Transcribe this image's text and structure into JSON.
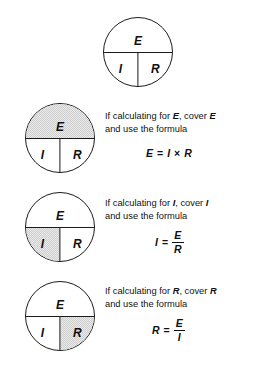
{
  "diagram": {
    "wheel_labels": {
      "top": "E",
      "bottom_left": "I",
      "bottom_right": "R"
    },
    "colors": {
      "ink": "#111111",
      "shade": "#cfcfcf",
      "background": "#ffffff"
    }
  },
  "reference_wheel": {
    "label_e": "E",
    "label_i": "I",
    "label_r": "R"
  },
  "rows": [
    {
      "id": "solve-for-e",
      "shaded_quadrant": "top",
      "label_e": "E",
      "label_i": "I",
      "label_r": "R",
      "line1_prefix": "If calculating for ",
      "line1_var": "E",
      "line1_middle": ", cover ",
      "line1_var2": "E",
      "line2": "and use the formula",
      "formula": {
        "type": "product",
        "lhs": "E",
        "equals": "=",
        "operand1": "I",
        "operator": "×",
        "operand2": "R",
        "text": "E = I × R"
      }
    },
    {
      "id": "solve-for-i",
      "shaded_quadrant": "bottom_left",
      "label_e": "E",
      "label_i": "I",
      "label_r": "R",
      "line1_prefix": "If calculating for ",
      "line1_var": "I",
      "line1_middle": ", cover ",
      "line1_var2": "I",
      "line2": "and use the formula",
      "formula": {
        "type": "fraction",
        "lhs": "I",
        "equals": "=",
        "numerator": "E",
        "denominator": "R",
        "text": "I = E/R"
      }
    },
    {
      "id": "solve-for-r",
      "shaded_quadrant": "bottom_right",
      "label_e": "E",
      "label_i": "I",
      "label_r": "R",
      "line1_prefix": "If calculating for ",
      "line1_var": "R",
      "line1_middle": ", cover ",
      "line1_var2": "R",
      "line2": "and use the formula",
      "formula": {
        "type": "fraction",
        "lhs": "R",
        "equals": "=",
        "numerator": "E",
        "denominator": "I",
        "text": "R = E/I"
      }
    }
  ]
}
